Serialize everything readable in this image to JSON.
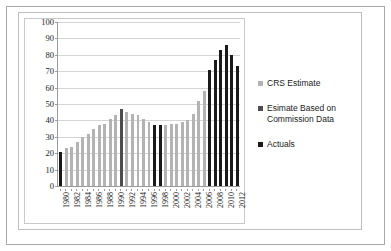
{
  "chart_data": {
    "type": "bar",
    "title": "",
    "xlabel": "",
    "ylabel": "",
    "ylim": [
      0,
      100
    ],
    "ytick_step": 10,
    "ytick_labels": [
      "100",
      "90",
      "80",
      "70",
      "60",
      "50",
      "40",
      "30",
      "20",
      "10",
      "0"
    ],
    "grid": true,
    "legend_position": "right",
    "categories": [
      "1980",
      "1981",
      "1982",
      "1983",
      "1984",
      "1985",
      "1986",
      "1987",
      "1988",
      "1989",
      "1990",
      "1991",
      "1992",
      "1993",
      "1994",
      "1995",
      "1996",
      "1997",
      "1998",
      "1999",
      "2000",
      "2001",
      "2002",
      "2003",
      "2004",
      "2005",
      "2006",
      "2007",
      "2008",
      "2009",
      "2010",
      "2011",
      "2012"
    ],
    "tick_label_interval": 2,
    "tick_labels_shown": [
      "1980",
      "1982",
      "1984",
      "1986",
      "1988",
      "1990",
      "1992",
      "1994",
      "1996",
      "1998",
      "2000",
      "2002",
      "2004",
      "2006",
      "2008",
      "2010",
      "2012"
    ],
    "series_names": [
      "CRS Estimate",
      "Esimate Based on Commission Data",
      "Actuals"
    ],
    "series_colors": {
      "crs": "#b3b3b3",
      "commission": "#4d4d4d",
      "actuals": "#1a1a1a"
    },
    "bars": [
      {
        "year": "1980",
        "value": 21,
        "series": "actuals"
      },
      {
        "year": "1981",
        "value": 23,
        "series": "crs"
      },
      {
        "year": "1982",
        "value": 24,
        "series": "crs"
      },
      {
        "year": "1983",
        "value": 27,
        "series": "crs"
      },
      {
        "year": "1984",
        "value": 30,
        "series": "crs"
      },
      {
        "year": "1985",
        "value": 32,
        "series": "crs"
      },
      {
        "year": "1986",
        "value": 35,
        "series": "crs"
      },
      {
        "year": "1987",
        "value": 37,
        "series": "crs"
      },
      {
        "year": "1988",
        "value": 38,
        "series": "crs"
      },
      {
        "year": "1989",
        "value": 41,
        "series": "crs"
      },
      {
        "year": "1990",
        "value": 43,
        "series": "crs"
      },
      {
        "year": "1991",
        "value": 47,
        "series": "commission"
      },
      {
        "year": "1992",
        "value": 45,
        "series": "crs"
      },
      {
        "year": "1993",
        "value": 44,
        "series": "crs"
      },
      {
        "year": "1994",
        "value": 43,
        "series": "crs"
      },
      {
        "year": "1995",
        "value": 41,
        "series": "crs"
      },
      {
        "year": "1996",
        "value": 39,
        "series": "crs"
      },
      {
        "year": "1997",
        "value": 37,
        "series": "actuals"
      },
      {
        "year": "1998",
        "value": 37,
        "series": "actuals"
      },
      {
        "year": "1999",
        "value": 37,
        "series": "crs"
      },
      {
        "year": "2000",
        "value": 38,
        "series": "crs"
      },
      {
        "year": "2001",
        "value": 38,
        "series": "crs"
      },
      {
        "year": "2002",
        "value": 39,
        "series": "crs"
      },
      {
        "year": "2003",
        "value": 40,
        "series": "crs"
      },
      {
        "year": "2004",
        "value": 44,
        "series": "crs"
      },
      {
        "year": "2005",
        "value": 52,
        "series": "crs"
      },
      {
        "year": "2006",
        "value": 58,
        "series": "crs"
      },
      {
        "year": "2007",
        "value": 71,
        "series": "actuals"
      },
      {
        "year": "2008",
        "value": 77,
        "series": "actuals"
      },
      {
        "year": "2009",
        "value": 83,
        "series": "actuals"
      },
      {
        "year": "2010",
        "value": 86,
        "series": "actuals"
      },
      {
        "year": "2011",
        "value": 80,
        "series": "actuals"
      },
      {
        "year": "2012",
        "value": 73,
        "series": "actuals"
      }
    ]
  },
  "legend": {
    "items": [
      {
        "label": "CRS Estimate",
        "series": "crs"
      },
      {
        "label": "Esimate Based on Commission Data",
        "series": "commission"
      },
      {
        "label": "Actuals",
        "series": "actuals"
      }
    ]
  }
}
